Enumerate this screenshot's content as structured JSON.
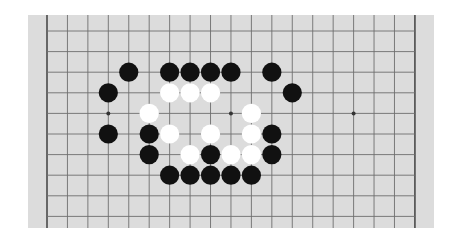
{
  "board": {
    "size": 19,
    "origin_x": 19,
    "origin_y": 16,
    "spacing_x": 20.44,
    "spacing_y": 20.6,
    "visible_rows": [
      -1,
      10
    ],
    "colors": {
      "background": "#dcdcdc",
      "line": "#6e6e6e",
      "edge_line": "#4a4a4a",
      "black_stone": "#111111",
      "white_stone": "#ffffff",
      "star_point": "#333333"
    },
    "star_points": [
      [
        3,
        4
      ],
      [
        9,
        4
      ],
      [
        15,
        4
      ]
    ],
    "stones": [
      {
        "col": 4,
        "row": 2,
        "color": "black"
      },
      {
        "col": 6,
        "row": 2,
        "color": "black"
      },
      {
        "col": 7,
        "row": 2,
        "color": "black"
      },
      {
        "col": 8,
        "row": 2,
        "color": "black"
      },
      {
        "col": 9,
        "row": 2,
        "color": "black"
      },
      {
        "col": 11,
        "row": 2,
        "color": "black"
      },
      {
        "col": 3,
        "row": 3,
        "color": "black"
      },
      {
        "col": 6,
        "row": 3,
        "color": "white"
      },
      {
        "col": 7,
        "row": 3,
        "color": "white"
      },
      {
        "col": 8,
        "row": 3,
        "color": "white"
      },
      {
        "col": 12,
        "row": 3,
        "color": "black"
      },
      {
        "col": 5,
        "row": 4,
        "color": "white"
      },
      {
        "col": 10,
        "row": 4,
        "color": "white"
      },
      {
        "col": 3,
        "row": 5,
        "color": "black"
      },
      {
        "col": 5,
        "row": 5,
        "color": "black"
      },
      {
        "col": 6,
        "row": 5,
        "color": "white"
      },
      {
        "col": 8,
        "row": 5,
        "color": "white"
      },
      {
        "col": 10,
        "row": 5,
        "color": "white"
      },
      {
        "col": 11,
        "row": 5,
        "color": "black"
      },
      {
        "col": 5,
        "row": 6,
        "color": "black"
      },
      {
        "col": 7,
        "row": 6,
        "color": "white"
      },
      {
        "col": 8,
        "row": 6,
        "color": "black"
      },
      {
        "col": 9,
        "row": 6,
        "color": "white"
      },
      {
        "col": 10,
        "row": 6,
        "color": "white"
      },
      {
        "col": 11,
        "row": 6,
        "color": "black"
      },
      {
        "col": 6,
        "row": 7,
        "color": "black"
      },
      {
        "col": 7,
        "row": 7,
        "color": "black"
      },
      {
        "col": 8,
        "row": 7,
        "color": "black"
      },
      {
        "col": 9,
        "row": 7,
        "color": "black"
      },
      {
        "col": 10,
        "row": 7,
        "color": "black"
      }
    ]
  }
}
